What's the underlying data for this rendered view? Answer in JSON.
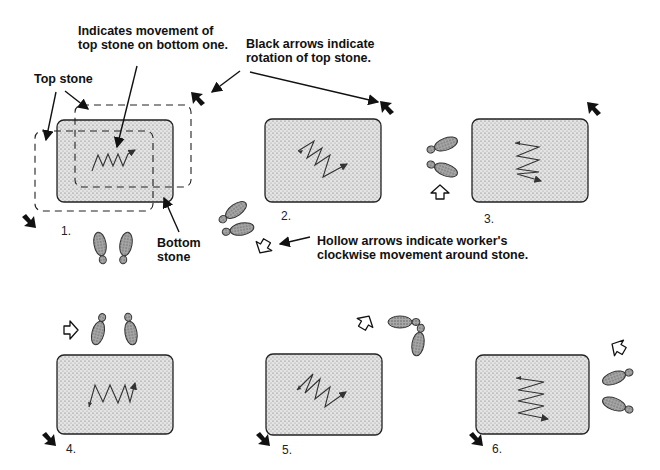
{
  "labels": {
    "movement": [
      "Indicates movement of",
      "top stone on bottom one."
    ],
    "black_arrows": [
      "Black arrows indicate",
      "rotation of top stone."
    ],
    "top_stone": "Top stone",
    "bottom_stone": [
      "Bottom",
      "stone"
    ],
    "hollow_arrows": [
      "Hollow arrows indicate worker's",
      "clockwise movement around stone."
    ]
  },
  "steps": [
    {
      "number": "1.",
      "stroke": "horizontal zigzag"
    },
    {
      "number": "2.",
      "stroke": "diagonal zigzag"
    },
    {
      "number": "3.",
      "stroke": "vertical zigzag"
    },
    {
      "number": "4.",
      "stroke": "horizontal zigzag"
    },
    {
      "number": "5.",
      "stroke": "diagonal zigzag"
    },
    {
      "number": "6.",
      "stroke": "vertical zigzag"
    }
  ],
  "icons": {
    "black_arrow": "rotation-arrow-icon",
    "hollow_arrow": "worker-movement-arrow-icon",
    "footprints": "footprints-icon"
  },
  "colors": {
    "stone_fill": "#d9d9d9",
    "ink": "#111111",
    "footprint_fill": "#9a9a9a"
  }
}
